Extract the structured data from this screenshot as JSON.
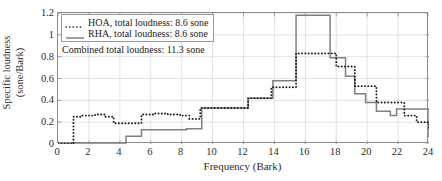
{
  "chart_data": {
    "type": "line",
    "title": "",
    "xlabel": "Frequency (Bark)",
    "ylabel_line1": "Specific loudness",
    "ylabel_line2": "(sone/Bark)",
    "xlim": [
      0,
      24
    ],
    "ylim": [
      0,
      1.2
    ],
    "xticks": [
      0,
      2,
      4,
      6,
      8,
      10,
      12,
      14,
      16,
      18,
      20,
      22,
      24
    ],
    "yticks": [
      0,
      0.2,
      0.4,
      0.6,
      0.8,
      1,
      1.2
    ],
    "ytick_labels": [
      "0",
      "0.2",
      "0.4",
      "0.6",
      "0.8",
      "1",
      "1.2"
    ],
    "xtick_labels": [
      "0",
      "2",
      "4",
      "6",
      "8",
      "10",
      "12",
      "14",
      "16",
      "18",
      "20",
      "22",
      "24"
    ],
    "grid": true,
    "grid_color": "#d9d9d9",
    "legend_position": "top-left",
    "drawstyle": "steps-post",
    "series": [
      {
        "name": "HOA, total loudness: 8.6 sone",
        "short_name": "HOA",
        "style": "dotted",
        "color": "#1a1a1a",
        "x": [
          0,
          1,
          1,
          1.5,
          2.4,
          3.0,
          3.6,
          4.9,
          5.4,
          6.2,
          7.1,
          7.9,
          8.5,
          9.2,
          10.6,
          12.3,
          13.8,
          15.2,
          15.4,
          16.9,
          18.0,
          18.6,
          19.2,
          19.9,
          20.6,
          21.5,
          22.4,
          23.2,
          24
        ],
        "y": [
          0.0,
          0.0,
          0.25,
          0.26,
          0.27,
          0.25,
          0.19,
          0.19,
          0.27,
          0.28,
          0.27,
          0.26,
          0.23,
          0.33,
          0.33,
          0.42,
          0.52,
          0.52,
          0.83,
          0.83,
          0.71,
          0.71,
          0.53,
          0.53,
          0.38,
          0.38,
          0.26,
          0.2,
          0.13
        ],
        "values_note": "step curve, dotted black"
      },
      {
        "name": "RHA, total loudness: 8.6 sone",
        "short_name": "RHA",
        "style": "solid",
        "color": "#808080",
        "x": [
          0,
          4.3,
          4.4,
          5.3,
          5.4,
          6.3,
          8.3,
          9.2,
          9.3,
          10.6,
          12.2,
          12.3,
          13.8,
          13.9,
          15.2,
          15.4,
          16.8,
          17.6,
          18.0,
          18.6,
          19.2,
          19.9,
          20.6,
          21.5,
          21.9,
          22.6,
          24
        ],
        "y": [
          0.01,
          0.01,
          0.07,
          0.07,
          0.13,
          0.13,
          0.14,
          0.14,
          0.33,
          0.33,
          0.33,
          0.42,
          0.42,
          0.58,
          0.58,
          1.18,
          1.18,
          0.79,
          0.79,
          0.62,
          0.46,
          0.38,
          0.3,
          0.26,
          0.32,
          0.32,
          0.06
        ],
        "values_note": "step curve, solid gray"
      }
    ],
    "annotations": [
      {
        "name": "combined-total-loudness",
        "text": "Combined total loudness: 11.3 sone",
        "x_bark": 0.4,
        "y_value": 0.98
      }
    ]
  },
  "legend": {
    "items": [
      {
        "label": "HOA, total loudness: 8.6 sone",
        "style": "dotted",
        "color": "#1a1a1a"
      },
      {
        "label": "RHA, total loudness: 8.6 sone",
        "style": "solid",
        "color": "#808080"
      }
    ]
  },
  "axes": {
    "xlabel": "Frequency (Bark)",
    "ylabel_line1": "Specific loudness",
    "ylabel_line2": "(sone/Bark)"
  }
}
